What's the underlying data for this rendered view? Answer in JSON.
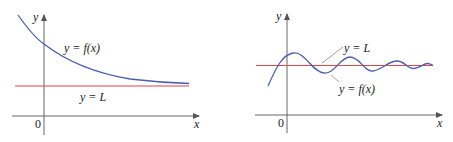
{
  "colors": {
    "axis": "#555555",
    "curve": "#4a5fb0",
    "asymptote": "#e0474c",
    "text": "#222222"
  },
  "left_graph": {
    "y_axis_label": "y",
    "x_axis_label": "x",
    "origin_label": "0",
    "curve_label": "y = f(x)",
    "line_label": "y = L",
    "description": "Decreasing curve approaching horizontal asymptote y = L from above"
  },
  "right_graph": {
    "y_axis_label": "y",
    "x_axis_label": "x",
    "origin_label": "0",
    "curve_label": "y = f(x)",
    "line_label": "y = L",
    "description": "Damped oscillating curve approaching horizontal asymptote y = L"
  }
}
